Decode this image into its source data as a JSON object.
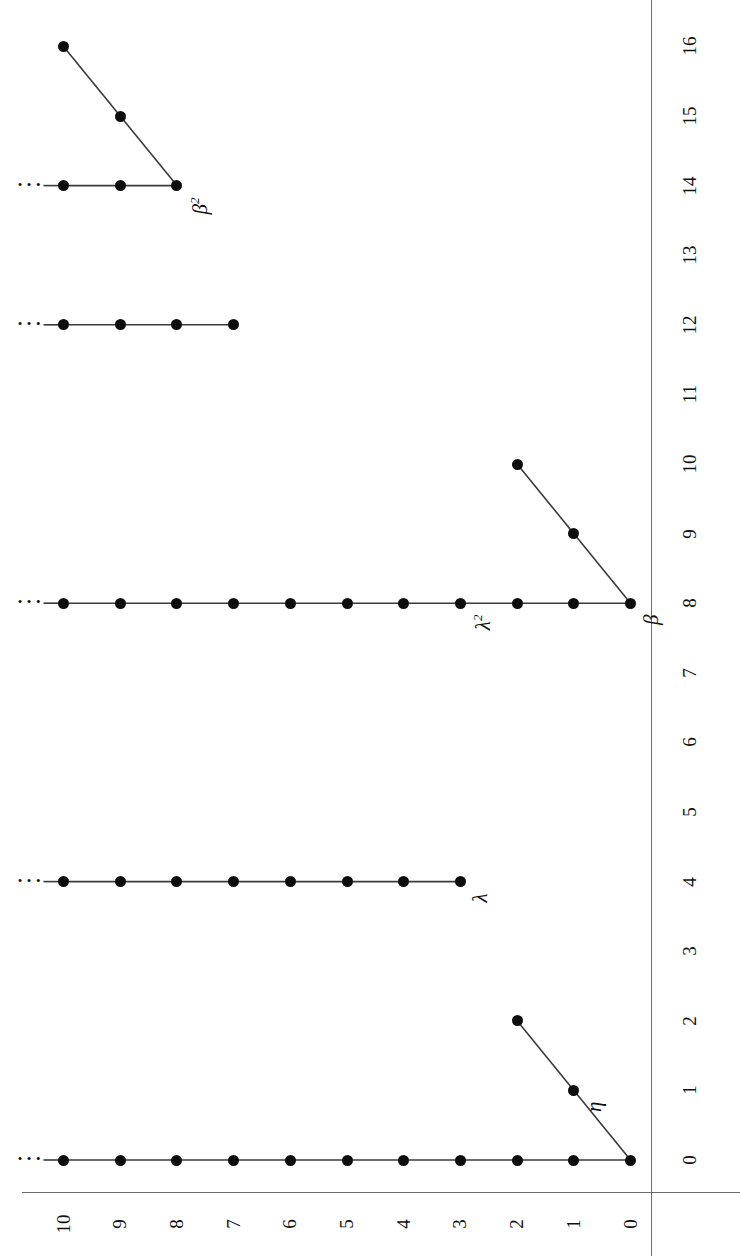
{
  "figure": {
    "orientation": "rotated-90-ccw",
    "background": "#ffffff",
    "ink_color": "#0d0d0d",
    "axis_color": "#6b6b6b"
  },
  "axes": {
    "value_axis": {
      "name": "value-axis",
      "tick_labels": [
        "10",
        "9",
        "8",
        "7",
        "6",
        "5",
        "4",
        "3",
        "2",
        "1",
        "0"
      ],
      "min": 0,
      "max": 10
    },
    "index_axis": {
      "name": "index-axis",
      "tick_labels": [
        "0",
        "1",
        "2",
        "3",
        "4",
        "5",
        "6",
        "7",
        "8",
        "9",
        "10",
        "11",
        "12",
        "13",
        "14",
        "15",
        "16",
        "17"
      ],
      "min": 0,
      "max": 17,
      "last_label_clipped": true
    }
  },
  "annotations": [
    {
      "id": "eta",
      "base": "η",
      "sup": "",
      "index": 1,
      "value": 1
    },
    {
      "id": "lambda",
      "base": "λ",
      "sup": "",
      "index": 4,
      "value": 3
    },
    {
      "id": "beta",
      "base": "β",
      "sup": "",
      "index": 8,
      "value": 0
    },
    {
      "id": "lambda2",
      "base": "λ",
      "sup": "2",
      "index": 8,
      "value": 3
    },
    {
      "id": "beta2",
      "base": "β",
      "sup": "2",
      "index": 14,
      "value": 8
    }
  ],
  "chart_data": {
    "type": "scatter",
    "title": "",
    "xlabel": "",
    "ylabel": "",
    "xlim": [
      0,
      17
    ],
    "ylim": [
      0,
      10
    ],
    "grid": false,
    "legend": null,
    "note": "Staircase of filtration levels; each cluster is a connected polyline of marked dots. Horizontal arms continue to the left (shown with an ellipsis) beyond value 10.",
    "clusters": [
      {
        "name": "eta-cluster",
        "label": "η",
        "anchor_index": 0,
        "continues_left": true,
        "points": [
          {
            "index": 0,
            "value": 0
          },
          {
            "index": 1,
            "value": 1
          },
          {
            "index": 2,
            "value": 2
          },
          {
            "index": 0,
            "value": 1
          },
          {
            "index": 0,
            "value": 2
          },
          {
            "index": 0,
            "value": 3
          },
          {
            "index": 0,
            "value": 4
          },
          {
            "index": 0,
            "value": 5
          },
          {
            "index": 0,
            "value": 6
          },
          {
            "index": 0,
            "value": 7
          },
          {
            "index": 0,
            "value": 8
          },
          {
            "index": 0,
            "value": 9
          },
          {
            "index": 0,
            "value": 10
          }
        ],
        "arm_horizontal": {
          "index": 0,
          "value_from": 0,
          "value_to": 10
        },
        "arm_diagonal": {
          "from": {
            "index": 0,
            "value": 0
          },
          "to": {
            "index": 2,
            "value": 2
          }
        }
      },
      {
        "name": "lambda-cluster",
        "label": "λ",
        "anchor_index": 4,
        "continues_left": true,
        "arm_horizontal": {
          "index": 4,
          "value_from": 3,
          "value_to": 10
        },
        "points": [
          {
            "index": 4,
            "value": 3
          },
          {
            "index": 4,
            "value": 4
          },
          {
            "index": 4,
            "value": 5
          },
          {
            "index": 4,
            "value": 6
          },
          {
            "index": 4,
            "value": 7
          },
          {
            "index": 4,
            "value": 8
          },
          {
            "index": 4,
            "value": 9
          },
          {
            "index": 4,
            "value": 10
          }
        ]
      },
      {
        "name": "beta-cluster",
        "label": "β",
        "anchor_index": 8,
        "continues_left": true,
        "arm_horizontal": {
          "index": 8,
          "value_from": 0,
          "value_to": 10
        },
        "arm_diagonal": {
          "from": {
            "index": 8,
            "value": 0
          },
          "to": {
            "index": 10,
            "value": 2
          }
        },
        "points": [
          {
            "index": 8,
            "value": 0
          },
          {
            "index": 9,
            "value": 1
          },
          {
            "index": 10,
            "value": 2
          },
          {
            "index": 8,
            "value": 1
          },
          {
            "index": 8,
            "value": 2
          },
          {
            "index": 8,
            "value": 3
          },
          {
            "index": 8,
            "value": 4
          },
          {
            "index": 8,
            "value": 5
          },
          {
            "index": 8,
            "value": 6
          },
          {
            "index": 8,
            "value": 7
          },
          {
            "index": 8,
            "value": 8
          },
          {
            "index": 8,
            "value": 9
          },
          {
            "index": 8,
            "value": 10
          }
        ]
      },
      {
        "name": "twelve-cluster",
        "label": "",
        "anchor_index": 12,
        "continues_left": true,
        "arm_horizontal": {
          "index": 12,
          "value_from": 7,
          "value_to": 10
        },
        "points": [
          {
            "index": 12,
            "value": 7
          },
          {
            "index": 12,
            "value": 8
          },
          {
            "index": 12,
            "value": 9
          },
          {
            "index": 12,
            "value": 10
          }
        ]
      },
      {
        "name": "beta2-cluster",
        "label": "β²",
        "anchor_index": 14,
        "continues_left": true,
        "arm_horizontal": {
          "index": 14,
          "value_from": 8,
          "value_to": 10
        },
        "arm_diagonal": {
          "from": {
            "index": 14,
            "value": 8
          },
          "to": {
            "index": 16,
            "value": 10
          }
        },
        "points": [
          {
            "index": 14,
            "value": 8
          },
          {
            "index": 15,
            "value": 9
          },
          {
            "index": 16,
            "value": 10
          },
          {
            "index": 14,
            "value": 9
          },
          {
            "index": 14,
            "value": 10
          }
        ]
      }
    ]
  }
}
